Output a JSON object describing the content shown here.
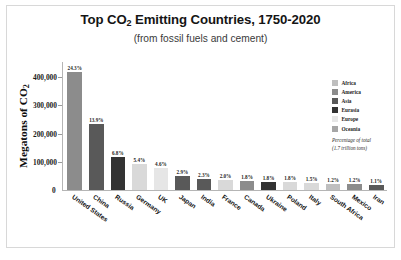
{
  "chart_data": {
    "type": "bar",
    "title": "Top CO2 Emitting Countries, 1750-2020",
    "title_parts": {
      "pre": "Top CO",
      "sub": "2",
      "post": " Emitting Countries, 1750-2020"
    },
    "subtitle": "(from fossil fuels and cement)",
    "xlabel": "",
    "ylabel": "Megatons of CO2",
    "ylabel_parts": {
      "pre": "Megatons of CO",
      "sub": "2"
    },
    "ylim": [
      0,
      440000
    ],
    "yticks": [
      0,
      100000,
      200000,
      300000,
      400000
    ],
    "ytick_labels": [
      "0",
      "100,000",
      "200,000",
      "300,000",
      "400,000"
    ],
    "grid": false,
    "legend_position": "right",
    "categories": [
      "United States",
      "China",
      "Russia",
      "Germany",
      "UK",
      "Japan",
      "India",
      "France",
      "Canada",
      "Ukraine",
      "Poland",
      "Italy",
      "South Africa",
      "Mexico",
      "Iran"
    ],
    "values": [
      417000,
      236000,
      116000,
      92000,
      78000,
      50000,
      39000,
      34000,
      31000,
      29000,
      27000,
      25000,
      20000,
      20000,
      19000
    ],
    "data_labels": [
      "24.3%",
      "13.9%",
      "6.8%",
      "5.4%",
      "4.6%",
      "2.9%",
      "2.3%",
      "2.0%",
      "1.8%",
      "1.8%",
      "1.8%",
      "1.5%",
      "1.2%",
      "1.2%",
      "1.1%"
    ],
    "bar_region": [
      "America",
      "Asia",
      "Eurasia",
      "Europe",
      "Europe",
      "Asia",
      "Asia",
      "Europe",
      "America",
      "Eurasia",
      "Europe",
      "Europe",
      "Africa",
      "America",
      "Asia"
    ],
    "bar_colors": [
      "#8c8c8c",
      "#595959",
      "#333333",
      "#d9d9d9",
      "#e6e6e6",
      "#595959",
      "#595959",
      "#d9d9d9",
      "#8c8c8c",
      "#333333",
      "#d9d9d9",
      "#d9d9d9",
      "#bfbfbf",
      "#8c8c8c",
      "#595959"
    ],
    "legend": [
      {
        "label": "Africa",
        "color": "#bfbfbf"
      },
      {
        "label": "America",
        "color": "#8c8c8c"
      },
      {
        "label": "Asia",
        "color": "#595959"
      },
      {
        "label": "Eurasia",
        "color": "#333333"
      },
      {
        "label": "Europe",
        "color": "#e6e6e6"
      },
      {
        "label": "Oceania",
        "color": "#a6a6a6"
      }
    ],
    "legend_note_line1": "Percentage of total",
    "legend_note_line2": "(1.7 trillion tons)"
  }
}
